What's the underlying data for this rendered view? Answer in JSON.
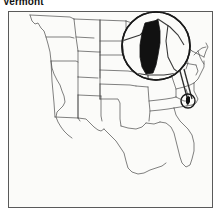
{
  "figure": {
    "title": "Vermont",
    "kind": "locator-map",
    "frame": {
      "x": 8,
      "y": 11,
      "width": 205,
      "height": 197
    },
    "background_color": "#fbfbf9",
    "line_color": "#4a4a4a",
    "frame_color": "#5a5a5a",
    "highlight_fill": "#111111"
  },
  "map": {
    "name": "united-states-outline",
    "region": "contiguous United States",
    "state_borders_visible": true,
    "highlighted_state": "Vermont",
    "highlighted_state_fill": "#111111"
  },
  "callout": {
    "name": "magnifier-callout",
    "magnifier_circle": {
      "cx": 156,
      "cy": 46,
      "r": 34
    },
    "target_circle": {
      "cx": 188,
      "cy": 101,
      "r": 7
    },
    "connector": {
      "x1": 180,
      "y1": 71,
      "x2": 188,
      "y2": 101
    },
    "target_state": "Vermont"
  },
  "icons": {
    "magnifier": "magnifier-icon",
    "location_marker": "location-circle-icon",
    "connector": "callout-connector-icon"
  }
}
